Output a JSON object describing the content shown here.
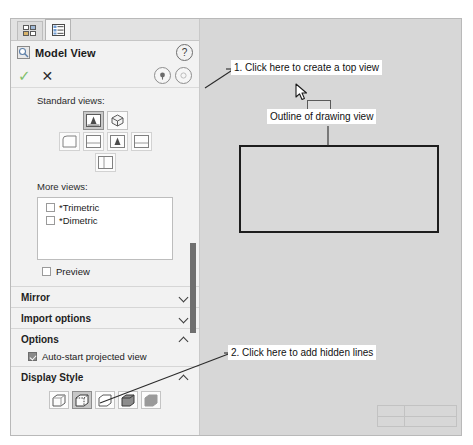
{
  "panel": {
    "tabs": [
      {
        "name": "feature-manager-tab",
        "icon": "tree-grid-icon",
        "active": false
      },
      {
        "name": "property-manager-tab",
        "icon": "property-list-icon",
        "active": true
      }
    ],
    "header": {
      "title": "Model View",
      "icon": "model-view-icon",
      "help_label": "?"
    },
    "actions": {
      "ok_glyph": "✓",
      "cancel_glyph": "✕",
      "keep_visible_icon": "pushpin-icon",
      "more_icon": "collapse-icon"
    },
    "standard_views": {
      "label": "Standard views:",
      "row1": [
        {
          "name": "view-front",
          "selected": true
        },
        {
          "name": "view-isometric",
          "selected": false
        }
      ],
      "row2": [
        {
          "name": "view-left",
          "selected": false
        },
        {
          "name": "view-top",
          "selected": false
        },
        {
          "name": "view-front-alt",
          "selected": false
        },
        {
          "name": "view-right",
          "selected": false
        }
      ],
      "row3": [
        {
          "name": "view-bottom",
          "selected": false
        }
      ]
    },
    "more_views": {
      "label": "More views:",
      "items": [
        {
          "label": "*Trimetric",
          "checked": false
        },
        {
          "label": "*Dimetric",
          "checked": false
        }
      ]
    },
    "preview": {
      "label": "Preview",
      "checked": false
    },
    "sections": [
      {
        "title": "Mirror",
        "expanded": false
      },
      {
        "title": "Import options",
        "expanded": false
      },
      {
        "title": "Options",
        "expanded": true
      },
      {
        "title": "Display Style",
        "expanded": true
      }
    ],
    "options": {
      "auto_start": {
        "label": "Auto-start projected view",
        "checked": true
      }
    },
    "display_style": {
      "buttons": [
        {
          "name": "wireframe",
          "selected": false
        },
        {
          "name": "hidden-lines-visible",
          "selected": true
        },
        {
          "name": "hidden-lines-removed",
          "selected": false
        },
        {
          "name": "shaded-with-edges",
          "selected": false
        },
        {
          "name": "shaded",
          "selected": false
        }
      ]
    }
  },
  "canvas": {
    "outline_label": "Outline of drawing view",
    "cursor_icon": "arrow-cursor-icon",
    "preview_rect_name": "view-placement-preview"
  },
  "callouts": [
    {
      "text": "1. Click here to create a top view"
    },
    {
      "text": "2. Click here to add hidden lines"
    }
  ],
  "colors": {
    "panel_bg": "#f2f2f2",
    "canvas_bg": "#d7d7d7",
    "selected_btn": "#c9c9c9",
    "ok_green": "#7fbf6a",
    "outline_stroke": "#1d1d1d"
  }
}
